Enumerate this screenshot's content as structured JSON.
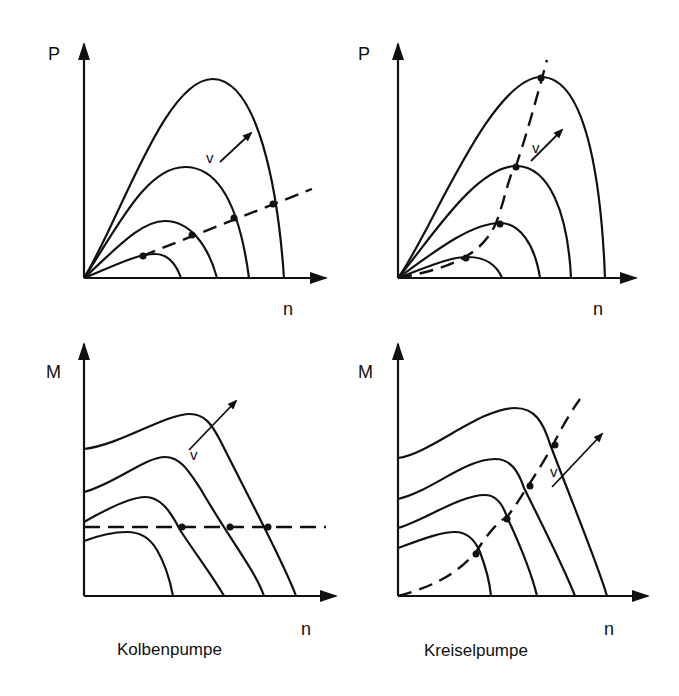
{
  "figure": {
    "panels": [
      {
        "id": "top-left",
        "y_label": "P",
        "x_label": "n",
        "param_label": "v",
        "pump": "Kolbenpumpe",
        "quantity": "power"
      },
      {
        "id": "top-right",
        "y_label": "P",
        "x_label": "n",
        "param_label": "v",
        "pump": "Kreiselpumpe",
        "quantity": "power"
      },
      {
        "id": "bottom-left",
        "y_label": "M",
        "x_label": "n",
        "param_label": "v",
        "pump": "Kolbenpumpe",
        "quantity": "torque"
      },
      {
        "id": "bottom-right",
        "y_label": "M",
        "x_label": "n",
        "param_label": "v",
        "pump": "Kreiselpumpe",
        "quantity": "torque"
      }
    ],
    "captions": {
      "left": "Kolbenpumpe",
      "right": "Kreiselpumpe"
    },
    "colors": {
      "ink": "#111111",
      "background": "#ffffff"
    }
  }
}
